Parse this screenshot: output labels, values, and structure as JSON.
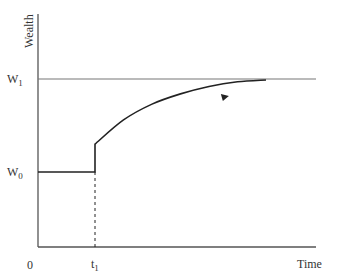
{
  "chart_data": {
    "type": "line",
    "title": "",
    "xlabel": "Time",
    "ylabel": "Wealth",
    "origin_label": "0",
    "x_ticks": [
      {
        "label": "t",
        "sub": "1",
        "value": 1
      }
    ],
    "y_ticks": [
      {
        "label": "W",
        "sub": "1",
        "value": 1.0
      },
      {
        "label": "W",
        "sub": "0",
        "value": 0.0
      }
    ],
    "xlim": [
      0,
      4.0
    ],
    "ylim": [
      -1.0,
      1.7
    ],
    "series": [
      {
        "name": "wealth-path",
        "description": "Constant at W0 until t1, jumps up, then rises asymptotically toward W1",
        "x": [
          0,
          1,
          1,
          1.5,
          2,
          2.5,
          3,
          3.5,
          4.0
        ],
        "y": [
          0,
          0,
          0.3,
          0.56,
          0.73,
          0.84,
          0.92,
          0.97,
          0.99
        ]
      }
    ],
    "reference_lines": [
      {
        "name": "W1-level",
        "axis": "y",
        "value": 1.0
      },
      {
        "name": "t1-dashed",
        "axis": "x",
        "value": 1,
        "from": -1.0,
        "to": 0,
        "style": "dashed"
      }
    ],
    "annotations": [
      {
        "type": "arrow",
        "on": "wealth-path",
        "at_x": 2.05,
        "direction": "forward"
      }
    ],
    "grid": false,
    "legend": "none"
  },
  "colors": {
    "axis": "#555555",
    "curve": "#222222",
    "reference": "#777777",
    "text": "#333333"
  }
}
